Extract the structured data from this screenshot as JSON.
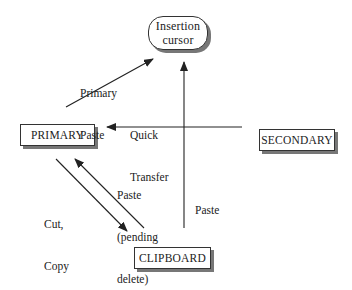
{
  "nodes": {
    "insertion_cursor": {
      "line1": "Insertion",
      "line2": "cursor"
    },
    "primary": {
      "label": "PRIMARY"
    },
    "secondary": {
      "label": "SECONDARY"
    },
    "clipboard": {
      "label": "CLIPBOARD"
    }
  },
  "edges": {
    "primary_paste": {
      "line1": "Primary",
      "line2": "Paste",
      "from": "PRIMARY",
      "to": "Insertion cursor"
    },
    "quick_transfer": {
      "line1": "Quick",
      "line2": "Transfer",
      "from": "SECONDARY",
      "to": "PRIMARY"
    },
    "cut_copy": {
      "line1": "Cut,",
      "line2": "Copy",
      "from": "PRIMARY",
      "to": "CLIPBOARD"
    },
    "paste_pending_delete": {
      "line1": "Paste",
      "line2": "(pending",
      "line3": "delete)",
      "from": "CLIPBOARD",
      "to": "PRIMARY"
    },
    "paste": {
      "label": "Paste",
      "from": "CLIPBOARD",
      "to": "Insertion cursor"
    }
  },
  "colors": {
    "line": "#222222",
    "shadow": "#777777",
    "background": "#ffffff"
  }
}
